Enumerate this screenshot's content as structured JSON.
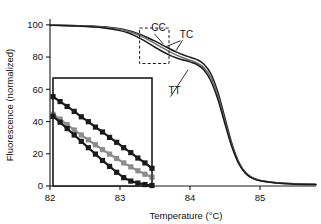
{
  "chart_data": {
    "type": "line",
    "title": "",
    "xlabel": "Temperature (°C)",
    "ylabel": "Fluorescence (normalized)",
    "xlim": [
      82,
      85.8
    ],
    "ylim": [
      0,
      103
    ],
    "xticks": [
      82,
      83,
      84,
      85
    ],
    "xticklabels": [
      "82",
      "83",
      "84",
      "85"
    ],
    "yticks": [
      0,
      20,
      40,
      60,
      80,
      100
    ],
    "yticklabels": [
      "0",
      "20",
      "40",
      "60",
      "80",
      "100"
    ],
    "grid": false,
    "legend": "inline-annotations",
    "annotations": [
      {
        "text": "CC",
        "x": 83.55,
        "y": 96,
        "points_to": {
          "x": 83.62,
          "y": 88
        }
      },
      {
        "text": "TC",
        "x": 83.95,
        "y": 92,
        "points_to": {
          "x": 83.8,
          "y": 84
        }
      },
      {
        "text": "TT",
        "x": 83.78,
        "y": 57,
        "points_to": {
          "x": 83.97,
          "y": 72
        }
      }
    ],
    "zoom_box": {
      "x0": 83.28,
      "x1": 83.7,
      "y0": 76,
      "y1": 98
    },
    "series": [
      {
        "name": "CC",
        "color": "#1a1a1a",
        "x": [
          82.0,
          82.2,
          82.4,
          82.6,
          82.8,
          83.0,
          83.1,
          83.2,
          83.3,
          83.4,
          83.5,
          83.6,
          83.7,
          83.8,
          83.9,
          84.0,
          84.1,
          84.2,
          84.3,
          84.4,
          84.5,
          84.6,
          84.7,
          84.8,
          84.9,
          85.0,
          85.2,
          85.4,
          85.6,
          85.8
        ],
        "y": [
          99.8,
          99.7,
          99.5,
          99.2,
          98.7,
          97.6,
          96.7,
          95.5,
          93.9,
          92.0,
          89.9,
          87.6,
          85.3,
          83.2,
          81.4,
          79.9,
          78.4,
          75.6,
          69.5,
          58.0,
          42.0,
          26.0,
          14.5,
          8.0,
          5.0,
          3.5,
          2.2,
          1.6,
          1.2,
          1.0
        ]
      },
      {
        "name": "TC",
        "color": "#6e6e6e",
        "x": [
          82.0,
          82.2,
          82.4,
          82.6,
          82.8,
          83.0,
          83.1,
          83.2,
          83.3,
          83.4,
          83.5,
          83.6,
          83.7,
          83.8,
          83.9,
          84.0,
          84.1,
          84.2,
          84.3,
          84.4,
          84.5,
          84.6,
          84.7,
          84.8,
          84.9,
          85.0,
          85.2,
          85.4,
          85.6,
          85.8
        ],
        "y": [
          99.8,
          99.6,
          99.4,
          99.0,
          98.4,
          97.2,
          96.2,
          94.8,
          93.0,
          90.8,
          88.4,
          85.9,
          83.5,
          81.4,
          79.6,
          78.0,
          76.4,
          73.4,
          67.2,
          55.8,
          40.2,
          25.0,
          14.0,
          7.8,
          4.8,
          3.4,
          2.1,
          1.5,
          1.1,
          0.9
        ]
      },
      {
        "name": "TT",
        "color": "#1a1a1a",
        "x": [
          82.0,
          82.2,
          82.4,
          82.6,
          82.8,
          83.0,
          83.1,
          83.2,
          83.3,
          83.4,
          83.5,
          83.6,
          83.7,
          83.8,
          83.9,
          84.0,
          84.1,
          84.2,
          84.3,
          84.4,
          84.5,
          84.6,
          84.7,
          84.8,
          84.9,
          85.0,
          85.2,
          85.4,
          85.6,
          85.8
        ],
        "y": [
          99.7,
          99.5,
          99.2,
          98.7,
          97.9,
          96.4,
          95.2,
          93.5,
          91.3,
          88.8,
          86.1,
          83.6,
          81.4,
          79.6,
          78.2,
          77.0,
          75.4,
          72.0,
          65.0,
          53.5,
          38.5,
          24.0,
          13.5,
          7.5,
          4.6,
          3.2,
          2.0,
          1.4,
          1.0,
          0.9
        ]
      }
    ],
    "inset": {
      "description": "Magnified view of boxed region showing three genotype curves with square markers",
      "xlim": [
        83.28,
        83.7
      ],
      "ylim": [
        76,
        98
      ],
      "series": [
        {
          "name": "CC",
          "color": "#1a1a1a",
          "marker": "square",
          "x": [
            83.28,
            83.31,
            83.34,
            83.37,
            83.4,
            83.43,
            83.46,
            83.49,
            83.52,
            83.55,
            83.58,
            83.61,
            83.64,
            83.67,
            83.7
          ],
          "y": [
            94.2,
            93.2,
            92.2,
            91.2,
            90.1,
            89.1,
            88.0,
            87.0,
            85.9,
            84.9,
            83.8,
            82.8,
            81.7,
            80.7,
            79.6
          ]
        },
        {
          "name": "TC",
          "color": "#8c8c8c",
          "marker": "square",
          "x": [
            83.28,
            83.31,
            83.34,
            83.37,
            83.4,
            83.43,
            83.46,
            83.49,
            83.52,
            83.55,
            83.58,
            83.61,
            83.64,
            83.67,
            83.7
          ],
          "y": [
            90.6,
            89.6,
            88.5,
            87.4,
            86.4,
            85.4,
            84.4,
            83.4,
            82.5,
            81.6,
            80.7,
            79.9,
            79.1,
            78.4,
            77.8
          ]
        },
        {
          "name": "TT",
          "color": "#1a1a1a",
          "marker": "square",
          "x": [
            83.28,
            83.31,
            83.34,
            83.37,
            83.4,
            83.43,
            83.46,
            83.49,
            83.52,
            83.55,
            83.58,
            83.61,
            83.64,
            83.67,
            83.7
          ],
          "y": [
            90.2,
            89.0,
            87.7,
            86.4,
            85.1,
            83.8,
            82.5,
            81.2,
            80.0,
            78.8,
            77.7,
            77.0,
            76.6,
            76.3,
            76.1
          ]
        }
      ]
    }
  }
}
